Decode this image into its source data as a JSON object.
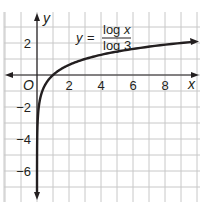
{
  "chart_data": {
    "type": "line",
    "title": "",
    "equation": {
      "lhs": "y",
      "equals": "=",
      "numerator": "log x",
      "denominator": "log 3"
    },
    "xlabel": "x",
    "ylabel": "y",
    "origin_label": "O",
    "xlim": [
      -2,
      10
    ],
    "ylim": [
      -7.5,
      4
    ],
    "grid": true,
    "x_ticks": [
      {
        "value": 2,
        "label": "2"
      },
      {
        "value": 4,
        "label": "4"
      },
      {
        "value": 6,
        "label": "6"
      },
      {
        "value": 8,
        "label": "8"
      }
    ],
    "y_ticks": [
      {
        "value": 2,
        "label": "2"
      },
      {
        "value": -2,
        "label": "−2"
      },
      {
        "value": -4,
        "label": "−4"
      },
      {
        "value": -6,
        "label": "−6"
      }
    ],
    "series": [
      {
        "name": "y = log x / log 3",
        "function": "log3(x)",
        "x": [
          0.0005,
          0.001,
          0.003,
          0.01,
          0.03,
          0.1,
          0.2,
          0.333,
          0.5,
          0.75,
          1,
          1.5,
          2,
          3,
          4,
          5,
          6,
          7,
          8,
          9,
          10
        ],
        "values": [
          -6.92,
          -6.29,
          -5.29,
          -4.19,
          -3.19,
          -2.1,
          -1.46,
          -1.0,
          -0.63,
          -0.26,
          0,
          0.37,
          0.63,
          1.0,
          1.26,
          1.46,
          1.63,
          1.77,
          1.89,
          2.0,
          2.1
        ]
      }
    ],
    "colors": {
      "curve": "#231f20",
      "axes": "#231f20",
      "grid": "#c8c8c8",
      "background": "#ffffff"
    }
  }
}
